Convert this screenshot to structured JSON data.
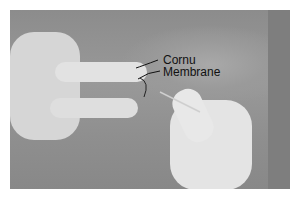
{
  "image": {
    "description": "Grayscale photo of gloved hands palpating the chest; one hand holds a needle near sternal notch",
    "annotations": [
      {
        "id": "cornu",
        "text": "Cornu"
      },
      {
        "id": "membrane",
        "text": "Membrane"
      }
    ]
  }
}
